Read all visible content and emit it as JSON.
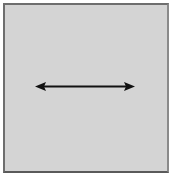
{
  "diagram": {
    "panel": {
      "background": "#d4d4d4",
      "border_color": "#6e6e6e"
    },
    "arrow": {
      "type": "double-headed-horizontal",
      "color": "#111111",
      "x1": 36,
      "x2": 134,
      "y": 86
    }
  }
}
